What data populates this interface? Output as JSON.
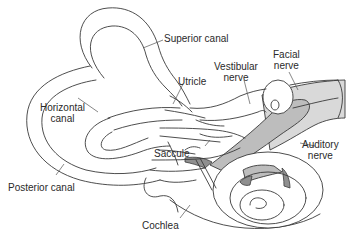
{
  "diagram": {
    "labels": {
      "superior_canal": "Superior canal",
      "utricle": "Utricle",
      "vestibular_nerve_line1": "Vestibular",
      "vestibular_nerve_line2": "nerve",
      "facial_nerve_line1": "Facial",
      "facial_nerve_line2": "nerve",
      "horizontal_canal_line1": "Horizontal",
      "horizontal_canal_line2": "canal",
      "saccule": "Saccule",
      "auditory_nerve_line1": "Auditory",
      "auditory_nerve_line2": "nerve",
      "posterior_canal": "Posterior canal",
      "cochlea": "Cochlea"
    },
    "colors": {
      "line": "#3a3a3a",
      "nerve_fill": "#bdbdbd",
      "nerve_light": "#d9d9d9",
      "shadow_fill": "#8f8f8f",
      "background": "#ffffff"
    }
  }
}
